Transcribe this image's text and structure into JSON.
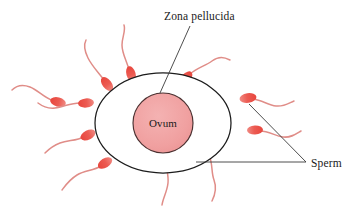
{
  "figure": {
    "background_color": "#ffffff",
    "width": 359,
    "height": 220
  },
  "labels": {
    "zona_pellucida": "Zona pellucida",
    "ovum": "Ovum",
    "sperm": "Sperm"
  },
  "colors": {
    "sperm_head": "#e8554c",
    "sperm_head_light": "#ef7f78",
    "sperm_tail": "#e08d88",
    "ovum_fill": "#f1a3a3",
    "ovum_stroke": "#4a3030",
    "zona_fill": "#ffffff",
    "zona_stroke": "#1c1c1c",
    "leader_line": "#3a3a3a",
    "text": "#1a1a1a"
  },
  "ovum": {
    "label": "Ovum",
    "center_x": 163,
    "center_y": 123,
    "radius": 30
  },
  "zona_pellucida": {
    "label": "Zona pellucida",
    "center_x": 163,
    "center_y": 123,
    "radius_x": 68,
    "radius_y": 50
  },
  "leader_lines": {
    "zona": {
      "label_x": 193,
      "label_y": 20,
      "from_x": 190,
      "from_y": 25,
      "to_x": 160,
      "to_y": 93
    },
    "sperm_horizontal": {
      "from_x": 196,
      "from_y": 162,
      "to_x": 306,
      "to_y": 162
    },
    "sperm_diagonal": {
      "from_x": 248,
      "from_y": 105,
      "to_x": 306,
      "to_y": 162
    },
    "sperm_label_x": 311,
    "sperm_label_y": 166
  },
  "sperm_count": 11,
  "sperm": [
    {
      "id": "sperm-top-left-outer",
      "head_x": 54,
      "head_y": 101,
      "angle": 20,
      "scale": 1.0
    },
    {
      "id": "sperm-top-left-mid",
      "head_x": 82,
      "head_y": 103,
      "angle": 8,
      "scale": 0.95
    },
    {
      "id": "sperm-upper-left",
      "head_x": 106,
      "head_y": 78,
      "angle": 55,
      "scale": 1.0
    },
    {
      "id": "sperm-top-center",
      "head_x": 131,
      "head_y": 68,
      "angle": 72,
      "scale": 1.0
    },
    {
      "id": "sperm-top-right",
      "head_x": 186,
      "head_y": 76,
      "angle": 120,
      "scale": 1.0
    },
    {
      "id": "sperm-right-outer",
      "head_x": 247,
      "head_y": 98,
      "angle": 175,
      "scale": 1.0
    },
    {
      "id": "sperm-right-far",
      "head_x": 255,
      "head_y": 130,
      "angle": 178,
      "scale": 0.95
    },
    {
      "id": "sperm-lower-right",
      "head_x": 208,
      "head_y": 150,
      "angle": 238,
      "scale": 0.95
    },
    {
      "id": "sperm-bottom-center",
      "head_x": 166,
      "head_y": 152,
      "angle": 268,
      "scale": 0.9
    },
    {
      "id": "sperm-lower-left-inner",
      "head_x": 88,
      "head_y": 135,
      "angle": 330,
      "scale": 1.0
    },
    {
      "id": "sperm-lower-left-outer",
      "head_x": 105,
      "head_y": 163,
      "angle": 315,
      "scale": 1.0
    }
  ]
}
